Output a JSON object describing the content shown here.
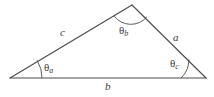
{
  "figure": {
    "type": "geometry-diagram",
    "shape": "triangle",
    "background_color": "#ffffff",
    "line_color": "#4a4a4a",
    "line_width": 1,
    "text_color": "#3a3a3a",
    "vertices": {
      "left": {
        "x": 10,
        "y": 78
      },
      "apex": {
        "x": 132,
        "y": 5
      },
      "right": {
        "x": 206,
        "y": 78
      }
    },
    "sides": [
      {
        "name": "side-c",
        "label": "c",
        "from": "left",
        "to": "apex",
        "label_x": 60,
        "label_y": 27
      },
      {
        "name": "side-a",
        "label": "a",
        "from": "apex",
        "to": "right",
        "label_x": 173,
        "label_y": 32
      },
      {
        "name": "side-b",
        "label": "b",
        "from": "left",
        "to": "right",
        "label_x": 105,
        "label_y": 81
      }
    ],
    "angles": [
      {
        "name": "angle-a",
        "theta": "θ",
        "subscript": "a",
        "vertex": "left",
        "arc_radius": 32,
        "label_x": 44,
        "label_y": 62
      },
      {
        "name": "angle-b",
        "theta": "θ",
        "subscript": "b",
        "vertex": "apex",
        "arc_radius": 21,
        "label_x": 119,
        "label_y": 25
      },
      {
        "name": "angle-c",
        "theta": "θ",
        "subscript": "c",
        "vertex": "right",
        "arc_radius": 25,
        "label_x": 170,
        "label_y": 58
      }
    ]
  }
}
